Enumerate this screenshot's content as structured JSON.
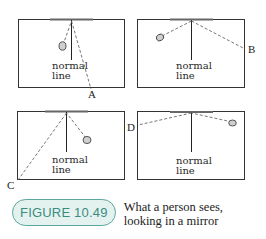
{
  "figure": {
    "number_label": "FIGURE 10.49",
    "caption_line1": "What a person sees,",
    "caption_line2": "looking in a mirror",
    "accent_color": "#5aa69c",
    "pill_fill": "#e4f2ef"
  },
  "panels": [
    {
      "id": "A",
      "normal_label_1": "normal",
      "normal_label_2": "line",
      "eye_point_label": "A"
    },
    {
      "id": "B",
      "normal_label_1": "normal",
      "normal_label_2": "line",
      "eye_point_label": "B"
    },
    {
      "id": "C",
      "normal_label_1": "normal",
      "normal_label_2": "line",
      "eye_point_label": "C"
    },
    {
      "id": "D",
      "normal_label_1": "normal",
      "normal_label_2": "line",
      "eye_point_label": "D"
    }
  ]
}
